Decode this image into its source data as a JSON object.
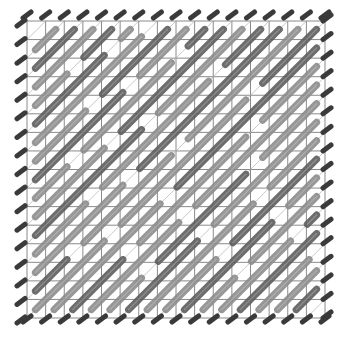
{
  "artwork": {
    "title": "Diagonal stroke grid pattern",
    "grid": {
      "columns": 16,
      "rows": 16
    },
    "colors": {
      "background": "#ffffff",
      "grid_line": "#8a8a8a",
      "edge_mark": "#3a3a3a",
      "stroke_light": "#8c8c8c",
      "stroke_dark": "#5e5e5e"
    },
    "edge_marks": {
      "top": 16,
      "left": 16,
      "right": 16,
      "bottom": 16
    },
    "diagonal_strokes": [
      {
        "row": 1,
        "col": 1,
        "length": 2
      },
      {
        "row": 0,
        "col": 3,
        "length": 3
      },
      {
        "row": 0,
        "col": 4,
        "length": 5
      },
      {
        "row": 0,
        "col": 6,
        "length": 6
      },
      {
        "row": 0,
        "col": 8,
        "length": 8
      },
      {
        "row": 0,
        "col": 10,
        "length": 9
      },
      {
        "row": 0,
        "col": 11,
        "length": 10
      },
      {
        "row": 0,
        "col": 13,
        "length": 3
      },
      {
        "row": 0,
        "col": 14,
        "length": 3
      },
      {
        "row": 2,
        "col": 0,
        "length": 10
      },
      {
        "row": 3,
        "col": 0,
        "length": 11
      },
      {
        "row": 4,
        "col": 0,
        "length": 12
      },
      {
        "row": 5,
        "col": 0,
        "length": 11
      },
      {
        "row": 6,
        "col": 0,
        "length": 10
      },
      {
        "row": 8,
        "col": 0,
        "length": 4
      },
      {
        "row": 9,
        "col": 0,
        "length": 6
      },
      {
        "row": 11,
        "col": 0,
        "length": 4
      },
      {
        "row": 12,
        "col": 0,
        "length": 3
      },
      {
        "row": 4,
        "col": 12,
        "length": 5
      },
      {
        "row": 3,
        "col": 15,
        "length": 9
      },
      {
        "row": 6,
        "col": 15,
        "length": 10
      },
      {
        "row": 8,
        "col": 15,
        "length": 8
      },
      {
        "row": 10,
        "col": 15,
        "length": 6
      },
      {
        "row": 12,
        "col": 15,
        "length": 3
      },
      {
        "row": 8,
        "col": 9,
        "length": 7
      },
      {
        "row": 7,
        "col": 12,
        "length": 9
      },
      {
        "row": 11,
        "col": 14,
        "length": 3
      }
    ]
  }
}
